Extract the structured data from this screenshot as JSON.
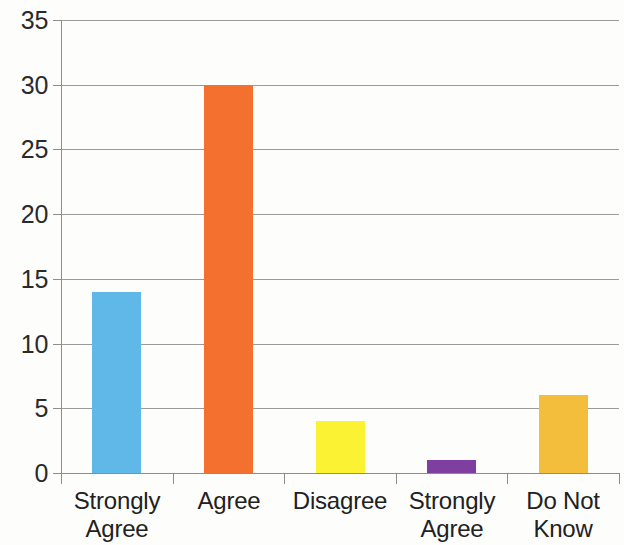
{
  "chart_data": {
    "type": "bar",
    "title": "",
    "subtitle": "",
    "xlabel": "",
    "ylabel": "",
    "categories": [
      "Strongly Agree",
      "Agree",
      "Disagree",
      "Strongly Agree",
      "Do Not Know"
    ],
    "category_lines": [
      [
        "Strongly",
        "Agree"
      ],
      [
        "Agree",
        ""
      ],
      [
        "Disagree",
        ""
      ],
      [
        "Strongly",
        "Agree"
      ],
      [
        "Do Not",
        "Know"
      ]
    ],
    "values": [
      14,
      30,
      4,
      1,
      6
    ],
    "bar_colors": [
      "#5FB8E8",
      "#F4702E",
      "#FAF232",
      "#7F3FA0",
      "#F2BE3C"
    ],
    "ylim": [
      0,
      35
    ],
    "ytick_step": 5,
    "ytick_labels": [
      "0",
      "5",
      "10",
      "15",
      "20",
      "25",
      "30",
      "35"
    ],
    "ytick_values": [
      0,
      5,
      10,
      15,
      20,
      25,
      30,
      35
    ],
    "grid": true,
    "grid_color": "#9a9a9a",
    "axis_color": "#8d8d8d",
    "legend": false,
    "legend_position": "none",
    "background_color": "#fdfdfc",
    "data_labels": false
  }
}
